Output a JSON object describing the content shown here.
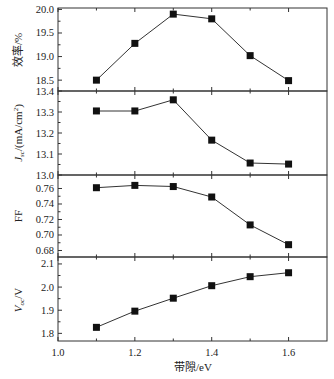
{
  "chart_data": {
    "type": "line",
    "layout": "stacked-panels",
    "shared_x": {
      "xlabel": "带隙/eV",
      "x": [
        1.1,
        1.2,
        1.3,
        1.4,
        1.5,
        1.6
      ],
      "xlim": [
        1.0,
        1.7
      ],
      "ticks": [
        "1.0",
        "1.2",
        "1.4",
        "1.6"
      ]
    },
    "panels": [
      {
        "id": "efficiency",
        "ylabel": "效率/%",
        "ylim": [
          18.27,
          20.03
        ],
        "ticks": [
          "18.5",
          "19.0",
          "19.5",
          "20.0"
        ],
        "values": [
          18.5,
          19.28,
          19.9,
          19.8,
          19.02,
          18.49
        ]
      },
      {
        "id": "jsc",
        "ylabel": "Jsc/(mA/cm²)",
        "ylim": [
          13.0,
          13.4
        ],
        "ticks": [
          "13.0",
          "13.1",
          "13.2",
          "13.3",
          "13.4"
        ],
        "values": [
          13.305,
          13.305,
          13.358,
          13.166,
          13.057,
          13.052
        ]
      },
      {
        "id": "ff",
        "ylabel": "FF",
        "ylim": [
          0.6716,
          0.7774
        ],
        "ticks": [
          "0.68",
          "0.70",
          "0.72",
          "0.74",
          "0.76"
        ],
        "values": [
          0.761,
          0.764,
          0.7625,
          0.749,
          0.713,
          0.6875
        ]
      },
      {
        "id": "voc",
        "ylabel": "Voc/V",
        "ylim": [
          1.767,
          2.13
        ],
        "ticks": [
          "1.8",
          "1.9",
          "2.0",
          "2.1"
        ],
        "values": [
          1.826,
          1.896,
          1.952,
          2.006,
          2.045,
          2.062
        ]
      }
    ],
    "marker": "filled-square",
    "grid": false,
    "legend": null
  },
  "labels": {
    "x_title": "带隙/eV",
    "y_eff": "效率/%",
    "y_jsc_main": "J",
    "y_jsc_sub": "sc",
    "y_jsc_rest": "/(mA/cm",
    "y_jsc_sup": "2",
    "y_jsc_close": ")",
    "y_ff": "FF",
    "y_voc_main": "V",
    "y_voc_sub": "oc",
    "y_voc_rest": "/V"
  }
}
